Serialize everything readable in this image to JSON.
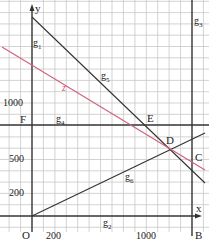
{
  "diagram": {
    "type": "linear-optimization-graph",
    "axes": {
      "x_label": "x",
      "y_label": "y",
      "origin_label": "O",
      "x_ticks": [
        {
          "value": 200,
          "label": "200"
        },
        {
          "value": 1000,
          "label": "1000"
        }
      ],
      "y_ticks": [
        {
          "value": 200,
          "label": "200"
        },
        {
          "value": 500,
          "label": "500"
        },
        {
          "value": 1000,
          "label": "1000"
        }
      ]
    },
    "points": {
      "B": "B",
      "C": "C",
      "D": "D",
      "E": "E",
      "F": "F"
    },
    "lines": {
      "g1": {
        "name": "g",
        "sub": "1"
      },
      "g2": {
        "name": "g",
        "sub": "2"
      },
      "g3": {
        "name": "g",
        "sub": "3"
      },
      "g4": {
        "name": "g",
        "sub": "4"
      },
      "g5": {
        "name": "g",
        "sub": "5"
      },
      "g6": {
        "name": "g",
        "sub": "6"
      },
      "z": {
        "name": "z"
      }
    },
    "colors": {
      "grid": "#c8c8c8",
      "axis": "#333333",
      "constraint": "#333333",
      "objective": "#d0607a",
      "background": "#ffffff"
    }
  }
}
